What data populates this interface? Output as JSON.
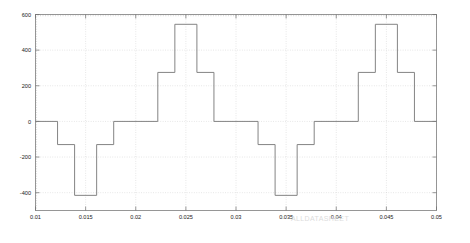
{
  "figure": {
    "background_color": "#ffffff",
    "axes_color": "#8c8c8c",
    "grid_color": "#c9c9c9",
    "line_color": "#7d7d7d",
    "watermark": "ALLDATASHEET"
  },
  "chart_data": {
    "type": "line",
    "title": "",
    "subtitle": "",
    "xlabel": "",
    "ylabel": "",
    "xlim": [
      0.01,
      0.05
    ],
    "ylim": [
      -500,
      600
    ],
    "grid": true,
    "legend": null,
    "legend_position": "none",
    "line_style": "staircase",
    "x_ticks": [
      0.01,
      0.015,
      0.02,
      0.025,
      0.03,
      0.035,
      0.04,
      0.045,
      0.05
    ],
    "x_tick_labels": [
      "0.01",
      "0.015",
      "0.02",
      "0.025",
      "0.03",
      "0.035",
      "0.04",
      "0.045",
      "0.05"
    ],
    "y_ticks": [
      600,
      400,
      200,
      0,
      -200,
      -400
    ],
    "y_tick_labels": [
      "600",
      "400",
      "200",
      "0",
      "-200",
      "-400"
    ],
    "series": [
      {
        "name": "output voltage",
        "x": [
          0.01,
          0.0122,
          0.0122,
          0.0139,
          0.0139,
          0.0161,
          0.0161,
          0.0178,
          0.0178,
          0.0222,
          0.0222,
          0.0239,
          0.0239,
          0.0261,
          0.0261,
          0.0278,
          0.0278,
          0.0322,
          0.0322,
          0.0339,
          0.0339,
          0.0361,
          0.0361,
          0.0378,
          0.0378,
          0.0422,
          0.0422,
          0.0439,
          0.0439,
          0.0461,
          0.0461,
          0.0478,
          0.0478,
          0.05
        ],
        "y": [
          0,
          0,
          -130,
          -130,
          -415,
          -415,
          -130,
          -130,
          0,
          0,
          275,
          275,
          545,
          545,
          275,
          275,
          0,
          0,
          -130,
          -130,
          -415,
          -415,
          -130,
          -130,
          0,
          0,
          275,
          275,
          545,
          545,
          275,
          275,
          0,
          0
        ]
      }
    ],
    "levels": {
      "positive": [
        0,
        275,
        545
      ],
      "negative": [
        0,
        -130,
        -415
      ]
    },
    "period": 0.02,
    "peak_positive": 545,
    "peak_negative": -415
  }
}
